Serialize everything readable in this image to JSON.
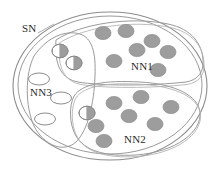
{
  "diagram": {
    "type": "set-venn-diagram",
    "title": "SN",
    "background_color": "#ffffff",
    "stroke_color": "#8c8c8c",
    "label_color": "#2b2b2b",
    "outer_set": {
      "name": "SN",
      "label": "SN",
      "label_x": 22,
      "label_y": 32,
      "shape": "ellipse",
      "cx": 110,
      "cy": 86,
      "rx": 97,
      "ry": 74,
      "has_double_outline": true,
      "inner_outline_offset": 5
    },
    "subsets": [
      {
        "name": "NN1",
        "label": "NN1",
        "label_x": 131,
        "label_y": 70,
        "path": "M 56 40 C 80 24 130 16 168 24 C 192 29 202 44 203 60 C 204 72 198 80 186 82 C 150 86 100 86 78 82 C 62 79 54 66 56 40 Z"
      },
      {
        "name": "NN2",
        "label": "NN2",
        "label_x": 124,
        "label_y": 143,
        "path": "M 74 96 C 82 84 104 80 140 82 C 176 84 198 96 200 112 C 202 132 176 152 136 155 C 104 157 84 150 76 136 C 69 124 69 106 74 96 Z"
      },
      {
        "name": "NN3",
        "label": "NN3",
        "label_x": 30,
        "label_y": 96,
        "path": "M 34 56 C 48 36 66 30 80 34 C 92 38 96 52 95 76 C 94 104 88 130 76 142 C 64 153 44 146 34 126 C 25 106 25 74 34 56 Z"
      }
    ],
    "glyph_colors": {
      "filled": "#9d9d9d",
      "filled_stroke": "#8a8a8a",
      "empty_fill": "#ffffff",
      "empty_stroke": "#8c8c8c",
      "half_fill": "#9d9d9d",
      "half_empty": "#ffffff"
    },
    "glyph_legend": {
      "filled_dot": "labeled-sample",
      "half_dot": "partially-labeled-sample",
      "empty_ellipse": "unlabeled-sample"
    },
    "filled_dots": [
      {
        "id": "nn1-d1",
        "region": "NN1",
        "cx": 103,
        "cy": 33,
        "rx": 8.0,
        "ry": 6.6
      },
      {
        "id": "nn1-d2",
        "region": "NN1",
        "cx": 126,
        "cy": 31,
        "rx": 8.0,
        "ry": 6.6
      },
      {
        "id": "nn1-d3",
        "region": "NN1",
        "cx": 152,
        "cy": 41,
        "rx": 8.0,
        "ry": 6.6
      },
      {
        "id": "nn1-d4",
        "region": "NN1",
        "cx": 137,
        "cy": 50,
        "rx": 8.0,
        "ry": 6.6
      },
      {
        "id": "nn1-d5",
        "region": "NN1",
        "cx": 168,
        "cy": 52,
        "rx": 8.0,
        "ry": 6.6
      },
      {
        "id": "nn1-d6",
        "region": "NN1",
        "cx": 114,
        "cy": 61,
        "rx": 8.0,
        "ry": 6.6
      },
      {
        "id": "nn1-d7",
        "region": "NN1",
        "cx": 158,
        "cy": 70,
        "rx": 8.0,
        "ry": 6.6
      },
      {
        "id": "nn2-d1",
        "region": "NN2",
        "cx": 141,
        "cy": 97,
        "rx": 8.0,
        "ry": 6.6
      },
      {
        "id": "nn2-d2",
        "region": "NN2",
        "cx": 114,
        "cy": 103,
        "rx": 8.0,
        "ry": 6.6
      },
      {
        "id": "nn2-d3",
        "region": "NN2",
        "cx": 171,
        "cy": 107,
        "rx": 8.0,
        "ry": 6.6
      },
      {
        "id": "nn2-d4",
        "region": "NN2",
        "cx": 129,
        "cy": 116,
        "rx": 8.0,
        "ry": 6.6
      },
      {
        "id": "nn2-d5",
        "region": "NN2",
        "cx": 155,
        "cy": 124,
        "rx": 8.0,
        "ry": 6.6
      },
      {
        "id": "nn2-d6",
        "region": "NN2",
        "cx": 96,
        "cy": 126,
        "rx": 8.0,
        "ry": 6.6
      },
      {
        "id": "nn2-d7",
        "region": "NN2",
        "cx": 104,
        "cy": 141,
        "rx": 8.0,
        "ry": 6.6
      }
    ],
    "half_dots": [
      {
        "id": "h1",
        "region": "NN3-NN1-overlap",
        "cx": 60,
        "cy": 51,
        "rx": 8.0,
        "ry": 6.8
      },
      {
        "id": "h2",
        "region": "NN3-NN1-overlap",
        "cx": 74,
        "cy": 63,
        "rx": 8.0,
        "ry": 6.8
      },
      {
        "id": "h3",
        "region": "NN3-NN2-overlap",
        "cx": 87,
        "cy": 113,
        "rx": 8.0,
        "ry": 6.8
      }
    ],
    "empty_ellipses": [
      {
        "id": "e1",
        "region": "NN3",
        "cx": 39,
        "cy": 79,
        "rx": 10.5,
        "ry": 6.0
      },
      {
        "id": "e2",
        "region": "NN3",
        "cx": 61,
        "cy": 98,
        "rx": 10.5,
        "ry": 6.0
      },
      {
        "id": "e3",
        "region": "NN3",
        "cx": 45,
        "cy": 119,
        "rx": 10.5,
        "ry": 6.0
      }
    ],
    "counts": {
      "filled_total": 14,
      "half_total": 3,
      "empty_total": 3,
      "nn1_filled": 7,
      "nn2_filled": 7
    }
  }
}
